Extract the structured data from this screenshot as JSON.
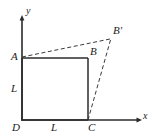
{
  "figure": {
    "type": "geometry-diagram",
    "colors": {
      "stroke": "#2b2b2b",
      "dashed": "#3a3a3a",
      "text": "#1a1a1a",
      "background": "#ffffff"
    },
    "axes": {
      "x_label": "x",
      "y_label": "y",
      "origin_label": "D"
    },
    "points": [
      {
        "name": "A",
        "label": "A",
        "x": 22,
        "y": 58
      },
      {
        "name": "B",
        "label": "B",
        "x": 88,
        "y": 58
      },
      {
        "name": "C",
        "label": "C",
        "x": 88,
        "y": 120
      },
      {
        "name": "D",
        "label": "D",
        "x": 22,
        "y": 120
      },
      {
        "name": "B-prime",
        "label": "B'",
        "x": 111,
        "y": 40
      }
    ],
    "side_labels": [
      {
        "name": "left-side-length",
        "label": "L"
      },
      {
        "name": "bottom-side-length",
        "label": "L"
      }
    ],
    "labels": {
      "A": "A",
      "B": "B",
      "C": "C",
      "D": "D",
      "B_prime": "B'",
      "x_axis": "x",
      "y_axis": "y",
      "L_vertical": "L",
      "L_horizontal": "L"
    },
    "segments": [
      {
        "name": "square-side-AB",
        "from": "A",
        "to": "B",
        "style": "solid"
      },
      {
        "name": "square-side-BC",
        "from": "B",
        "to": "C",
        "style": "solid"
      },
      {
        "name": "square-side-CD",
        "from": "C",
        "to": "D",
        "style": "solid"
      },
      {
        "name": "square-side-DA",
        "from": "D",
        "to": "A",
        "style": "solid"
      },
      {
        "name": "dashed-A-to-Bprime",
        "from": "A",
        "to": "B-prime",
        "style": "dashed"
      },
      {
        "name": "dashed-C-to-Bprime",
        "from": "C",
        "to": "B-prime",
        "style": "dashed"
      }
    ]
  }
}
